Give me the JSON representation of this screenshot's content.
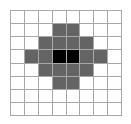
{
  "figure": {
    "name": "pixel-grid-pattern",
    "grid": {
      "columns": 8,
      "rows": 8,
      "line_color": "#a8a8a8",
      "background_color": "#ffffff"
    },
    "palette": {
      "empty": "#ffffff",
      "gray": "#646464",
      "black": "#000000"
    },
    "legend": {
      "empty_label": "empty",
      "gray_label": "gray",
      "black_label": "black"
    }
  },
  "chart_data": {
    "type": "heatmap",
    "title": "",
    "xlabel": "",
    "ylabel": "",
    "columns": 8,
    "rows": 8,
    "value_colors": {
      "0": "#ffffff",
      "1": "#646464",
      "2": "#000000"
    },
    "cells": [
      [
        0,
        0,
        0,
        0,
        0,
        0,
        0,
        0
      ],
      [
        0,
        0,
        0,
        1,
        1,
        0,
        0,
        0
      ],
      [
        0,
        0,
        1,
        1,
        1,
        1,
        0,
        0
      ],
      [
        0,
        1,
        1,
        2,
        2,
        1,
        1,
        0
      ],
      [
        0,
        0,
        1,
        1,
        1,
        1,
        0,
        0
      ],
      [
        0,
        0,
        0,
        1,
        1,
        0,
        0,
        0
      ],
      [
        0,
        0,
        0,
        0,
        0,
        0,
        0,
        0
      ],
      [
        0,
        0,
        0,
        0,
        0,
        0,
        0,
        0
      ]
    ]
  }
}
